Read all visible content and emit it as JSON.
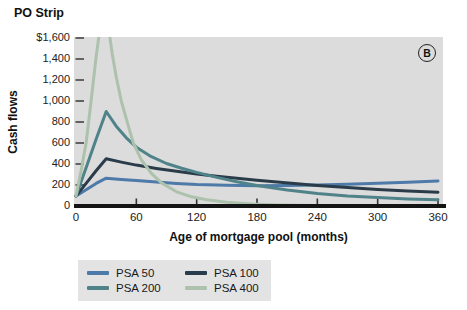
{
  "title": "PO Strip",
  "panel_badge": "B",
  "chart_data": {
    "type": "line",
    "title": "PO Strip",
    "xlabel": "Age of mortgage pool (months)",
    "ylabel": "Cash flows",
    "xlim": [
      0,
      360
    ],
    "ylim": [
      0,
      1600
    ],
    "grid": false,
    "plot_background": "#dcdcdc",
    "legend_position": "bottom-left",
    "x_ticks": [
      0,
      60,
      120,
      180,
      240,
      300,
      360
    ],
    "y_ticks": [
      {
        "value": 1600,
        "label": "$1,600"
      },
      {
        "value": 1400,
        "label": "1,400"
      },
      {
        "value": 1200,
        "label": "1,200"
      },
      {
        "value": 1000,
        "label": "1,000"
      },
      {
        "value": 800,
        "label": "800"
      },
      {
        "value": 600,
        "label": "600"
      },
      {
        "value": 400,
        "label": "400"
      },
      {
        "value": 200,
        "label": "200"
      },
      {
        "value": 0,
        "label": "0"
      }
    ],
    "series": [
      {
        "name": "PSA 50",
        "color": "#4d7aa8",
        "x": [
          0,
          10,
          20,
          30,
          45,
          60,
          80,
          100,
          120,
          150,
          180,
          210,
          240,
          270,
          300,
          330,
          360
        ],
        "y": [
          95,
          155,
          215,
          265,
          252,
          242,
          228,
          215,
          205,
          197,
          193,
          195,
          200,
          207,
          216,
          226,
          238
        ]
      },
      {
        "name": "PSA 100",
        "color": "#2a3b49",
        "x": [
          0,
          10,
          20,
          30,
          45,
          60,
          80,
          100,
          120,
          140,
          160,
          180,
          200,
          220,
          240,
          270,
          300,
          330,
          360
        ],
        "y": [
          95,
          215,
          335,
          450,
          418,
          390,
          358,
          330,
          305,
          284,
          264,
          246,
          228,
          212,
          196,
          175,
          157,
          142,
          130
        ]
      },
      {
        "name": "PSA 200",
        "color": "#4f8389",
        "x": [
          0,
          10,
          20,
          30,
          40,
          50,
          60,
          75,
          90,
          105,
          120,
          140,
          160,
          180,
          210,
          240,
          270,
          300,
          330,
          360
        ],
        "y": [
          95,
          365,
          635,
          900,
          760,
          650,
          560,
          470,
          405,
          360,
          320,
          272,
          230,
          195,
          152,
          120,
          96,
          80,
          68,
          60
        ]
      },
      {
        "name": "PSA 400",
        "color": "#adc2ad",
        "x": [
          0,
          5,
          10,
          15,
          20,
          24,
          28,
          32,
          36,
          40,
          45,
          50,
          57,
          65,
          75,
          85,
          100,
          115,
          130,
          150,
          175,
          200,
          240,
          280,
          320,
          360
        ],
        "y": [
          95,
          330,
          600,
          1000,
          1420,
          1700,
          1850,
          1720,
          1450,
          1230,
          1000,
          830,
          600,
          440,
          310,
          220,
          135,
          88,
          60,
          36,
          18,
          10,
          6,
          4,
          3,
          2
        ]
      }
    ]
  },
  "legend": {
    "items": [
      {
        "label": "PSA 50",
        "color": "#4d7aa8"
      },
      {
        "label": "PSA 100",
        "color": "#2a3b49"
      },
      {
        "label": "PSA 200",
        "color": "#4f8389"
      },
      {
        "label": "PSA 400",
        "color": "#adc2ad"
      }
    ]
  }
}
